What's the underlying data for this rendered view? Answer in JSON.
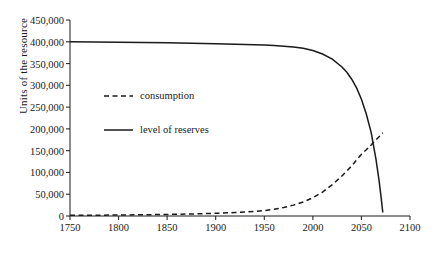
{
  "chart_data": {
    "type": "line",
    "title": "",
    "xlabel": "",
    "ylabel": "Units of the resource",
    "xlim": [
      1750,
      2100
    ],
    "ylim": [
      0,
      450000
    ],
    "grid": false,
    "legend_position": "inside-upper-left",
    "x_ticks": [
      "1750",
      "1800",
      "1850",
      "1900",
      "1950",
      "2000",
      "2050",
      "2100"
    ],
    "x_tick_values": [
      1750,
      1800,
      1850,
      1900,
      1950,
      2000,
      2050,
      2100
    ],
    "y_ticks": [
      "0",
      "50,000",
      "100,000",
      "150,000",
      "200,000",
      "250,000",
      "300,000",
      "350,000",
      "400,000",
      "450,000"
    ],
    "y_tick_values": [
      0,
      50000,
      100000,
      150000,
      200000,
      250000,
      300000,
      350000,
      400000,
      450000
    ],
    "series": [
      {
        "name": "consumption",
        "style": "dashed",
        "color": "#1a1a1a",
        "x": [
          1750,
          1775,
          1800,
          1825,
          1850,
          1875,
          1900,
          1920,
          1940,
          1950,
          1960,
          1970,
          1980,
          1990,
          2000,
          2010,
          2020,
          2030,
          2040,
          2050,
          2055,
          2060,
          2065,
          2070,
          2072
        ],
        "values": [
          1500,
          1800,
          2200,
          2800,
          3600,
          4700,
          6200,
          8000,
          10500,
          12500,
          15500,
          19500,
          25000,
          32000,
          42000,
          55000,
          72000,
          92000,
          115000,
          142000,
          152000,
          163000,
          175000,
          186000,
          191000
        ]
      },
      {
        "name": "level of reserves",
        "style": "solid",
        "color": "#1a1a1a",
        "x": [
          1750,
          1800,
          1850,
          1900,
          1930,
          1950,
          1960,
          1970,
          1980,
          1990,
          2000,
          2010,
          2020,
          2030,
          2035,
          2040,
          2045,
          2050,
          2055,
          2060,
          2065,
          2068,
          2070,
          2072
        ],
        "values": [
          400000,
          399000,
          397500,
          395500,
          394000,
          392500,
          391500,
          390000,
          388000,
          385000,
          380000,
          372000,
          360000,
          342000,
          330000,
          314000,
          294000,
          268000,
          234000,
          192000,
          130000,
          84000,
          48000,
          8000
        ]
      }
    ],
    "annotations": []
  },
  "legend": {
    "items": [
      {
        "label": "consumption",
        "style": "dashed"
      },
      {
        "label": "level of reserves",
        "style": "solid"
      }
    ]
  }
}
